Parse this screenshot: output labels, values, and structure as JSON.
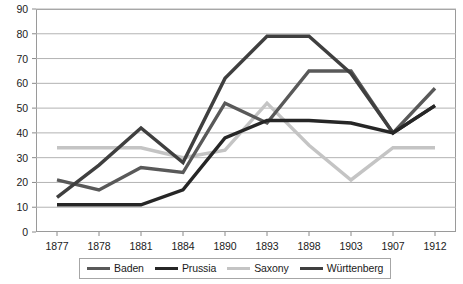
{
  "chart_data": {
    "type": "line",
    "title": "",
    "subtitle": "",
    "xlabel": "",
    "ylabel": "",
    "categories": [
      "1877",
      "1878",
      "1881",
      "1884",
      "1890",
      "1893",
      "1898",
      "1903",
      "1907",
      "1912"
    ],
    "ylim": [
      0,
      90
    ],
    "ytick_step": 10,
    "yticks": [
      "90",
      "80",
      "70",
      "60",
      "50",
      "40",
      "30",
      "20",
      "10",
      "0"
    ],
    "grid": true,
    "grid_axis": "y",
    "legend_position": "bottom",
    "series": [
      {
        "name": "Baden",
        "color": "#595959",
        "values": [
          21,
          17,
          26,
          24,
          52,
          44,
          65,
          65,
          40,
          58
        ]
      },
      {
        "name": "Prussia",
        "color": "#262626",
        "values": [
          11,
          11,
          11,
          17,
          38,
          45,
          45,
          44,
          40,
          51
        ]
      },
      {
        "name": "Saxony",
        "color": "#c4c4c4",
        "values": [
          34,
          34,
          34,
          30,
          33,
          52,
          35,
          21,
          34,
          34
        ]
      },
      {
        "name": "Württenberg",
        "color": "#3f3f3f",
        "values": [
          14,
          27,
          42,
          28,
          62,
          79,
          79,
          64,
          40,
          51
        ]
      }
    ]
  },
  "legend": {
    "items": [
      {
        "label": "Baden",
        "color": "#595959"
      },
      {
        "label": "Prussia",
        "color": "#262626"
      },
      {
        "label": "Saxony",
        "color": "#c4c4c4"
      },
      {
        "label": "Württenberg",
        "color": "#3f3f3f"
      }
    ]
  }
}
